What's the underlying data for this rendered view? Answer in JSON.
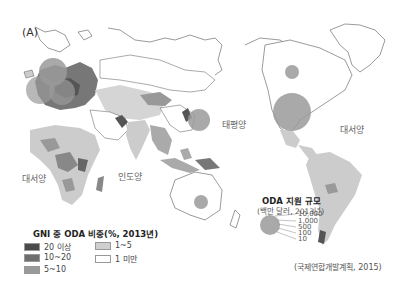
{
  "figure": {
    "panel_label": "(A)",
    "source": "(국제연합개발계획, 2015)"
  },
  "ocean_labels": {
    "atlantic_west": "대서양",
    "indian": "인도양",
    "pacific": "태평양",
    "atlantic_east": "대서양"
  },
  "gni_legend": {
    "title": "GNI 중 ODA 비중(%, 2013년)",
    "items": [
      {
        "label": "20 이상",
        "color": "#4a4a4a"
      },
      {
        "label": "10~20",
        "color": "#6f6f6f"
      },
      {
        "label": "5~10",
        "color": "#9a9a9a"
      },
      {
        "label": "1~5",
        "color": "#cfcfcf"
      },
      {
        "label": "1 미만",
        "color": "#ffffff"
      }
    ]
  },
  "oda_legend": {
    "title": "ODA 지원 규모",
    "subtitle": "(백만 달러, 2013년)",
    "values": [
      "10,000",
      "1,000",
      "500",
      "100",
      "10"
    ],
    "circle_color": "#9a9a9a"
  },
  "colors": {
    "circle": "#9a9a9a",
    "land_light": "#d5d5d5",
    "land_mid": "#a8a8a8",
    "land_dark": "#555555",
    "coast": "#555555"
  }
}
